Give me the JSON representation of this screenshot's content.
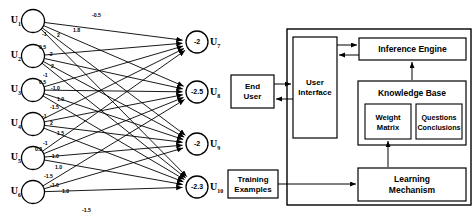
{
  "figure": {
    "left_panel_title": "neural-network-topology",
    "right_panel_title": "expert-system-architecture"
  },
  "network": {
    "input_nodes": [
      {
        "id": "U1",
        "label": "U",
        "sub": "1",
        "cx": 33,
        "cy": 21
      },
      {
        "id": "U2",
        "label": "U",
        "sub": "2",
        "cx": 33,
        "cy": 56
      },
      {
        "id": "U3",
        "label": "U",
        "sub": "3",
        "cx": 33,
        "cy": 90
      },
      {
        "id": "U4",
        "label": "U",
        "sub": "4",
        "cx": 33,
        "cy": 124
      },
      {
        "id": "U5",
        "label": "U",
        "sub": "5",
        "cx": 33,
        "cy": 158
      },
      {
        "id": "U6",
        "label": "U",
        "sub": "6",
        "cx": 33,
        "cy": 192
      }
    ],
    "output_nodes": [
      {
        "id": "U7",
        "label": "U",
        "sub": "7",
        "threshold": "-2",
        "cx": 197,
        "cy": 42
      },
      {
        "id": "U8",
        "label": "U",
        "sub": "8",
        "threshold": "-2.5",
        "cx": 197,
        "cy": 92
      },
      {
        "id": "U9",
        "label": "U",
        "sub": "9",
        "threshold": "-2",
        "cx": 197,
        "cy": 144
      },
      {
        "id": "U10",
        "label": "U",
        "sub": "10",
        "threshold": "-2.3",
        "cx": 197,
        "cy": 187
      }
    ],
    "weights": [
      {
        "from": "U1",
        "to": "U7",
        "value": "-0.5",
        "lx": 92,
        "ly": 12
      },
      {
        "from": "U1",
        "to": "U8",
        "value": "1.8",
        "lx": 73,
        "ly": 27
      },
      {
        "from": "U1",
        "to": "U9",
        "value": "2",
        "lx": 57,
        "ly": 32
      },
      {
        "from": "U1",
        "to": "U10",
        "value": "-1",
        "lx": 42,
        "ly": 31
      },
      {
        "from": "U2",
        "to": "U7",
        "value": "0.5",
        "lx": 39,
        "ly": 44
      },
      {
        "from": "U2",
        "to": "U8",
        "value": "-2",
        "lx": 48,
        "ly": 51
      },
      {
        "from": "U2",
        "to": "U9",
        "value": "2",
        "lx": 51,
        "ly": 63
      },
      {
        "from": "U2",
        "to": "U10",
        "value": "-1",
        "lx": 43,
        "ly": 72
      },
      {
        "from": "U3",
        "to": "U7",
        "value": "0.5",
        "lx": 39,
        "ly": 79
      },
      {
        "from": "U3",
        "to": "U8",
        "value": "-1.0",
        "lx": 51,
        "ly": 85
      },
      {
        "from": "U3",
        "to": "U9",
        "value": "1.0",
        "lx": 57,
        "ly": 96
      },
      {
        "from": "U3",
        "to": "U10",
        "value": "-1.5",
        "lx": 50,
        "ly": 104
      },
      {
        "from": "U4",
        "to": "U7",
        "value": "-1",
        "lx": 42,
        "ly": 113
      },
      {
        "from": "U4",
        "to": "U8",
        "value": "2",
        "lx": 50,
        "ly": 120
      },
      {
        "from": "U4",
        "to": "U9",
        "value": "1.5",
        "lx": 57,
        "ly": 130
      },
      {
        "from": "U4",
        "to": "U10",
        "value": "-1",
        "lx": 43,
        "ly": 140
      },
      {
        "from": "U5",
        "to": "U7",
        "value": "0.3",
        "lx": 35,
        "ly": 146
      },
      {
        "from": "U5",
        "to": "U8",
        "value": "-1.0",
        "lx": 50,
        "ly": 153
      },
      {
        "from": "U5",
        "to": "U9",
        "value": "1.0",
        "lx": 55,
        "ly": 164
      },
      {
        "from": "U5",
        "to": "U10",
        "value": "-1.5",
        "lx": 44,
        "ly": 173
      },
      {
        "from": "U6",
        "to": "U8",
        "value": "-1.0",
        "lx": 50,
        "ly": 182
      },
      {
        "from": "U6",
        "to": "U9",
        "value": "1.0",
        "lx": 62,
        "ly": 188
      },
      {
        "from": "U6",
        "to": "U10",
        "value": "-1.5",
        "lx": 82,
        "ly": 207
      }
    ]
  },
  "architecture": {
    "boxes": {
      "end_user": "End\nUser",
      "end_user_l1": "End",
      "end_user_l2": "User",
      "training_examples_l1": "Training",
      "training_examples_l2": "Examples",
      "user_interface_l1": "User",
      "user_interface_l2": "Interface",
      "inference_engine": "Inference Engine",
      "knowledge_base": "Knowledge Base",
      "weight_matrix_l1": "Weight",
      "weight_matrix_l2": "Matrix",
      "questions_conclusions_l1": "Questions",
      "questions_conclusions_l2": "Conclusions",
      "learning_mechanism_l1": "Learning",
      "learning_mechanism_l2": "Mechanism"
    }
  },
  "colors": {
    "stroke": "#000000",
    "background": "#ffffff"
  }
}
